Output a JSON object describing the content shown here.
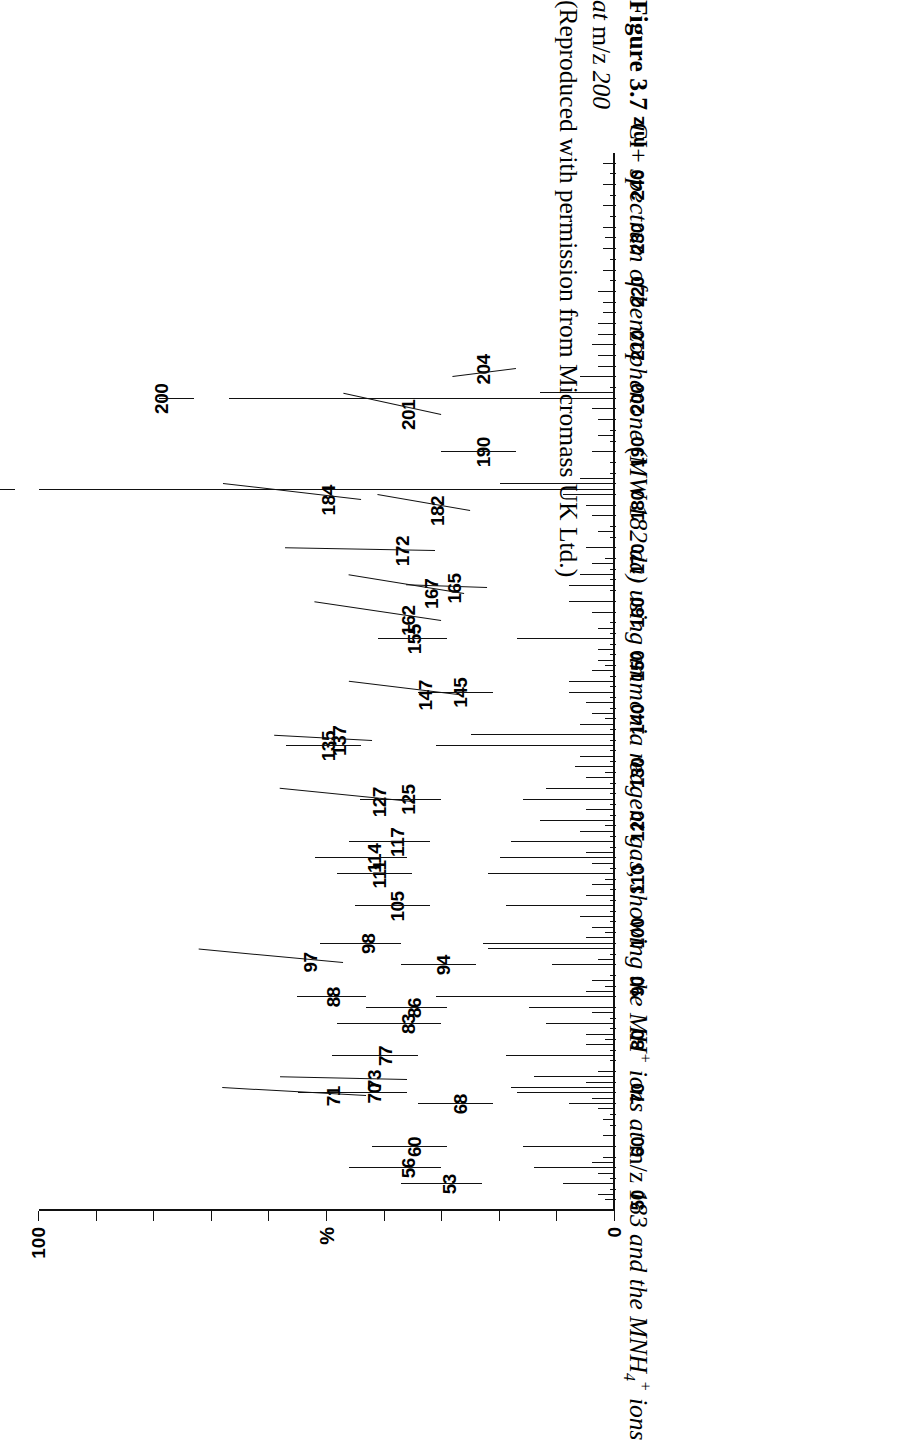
{
  "figure": {
    "label": "Figure 3.7",
    "caption_line1_a": "CI+ ",
    "caption_line1_b": "spectrum of benzophenone (MW 182 da) using ammonia reagent gas, showing the MH",
    "caption_line1_sup": "+",
    "caption_line1_c": " ions at ",
    "caption_line1_d": "m/z",
    "caption_line1_e": " 183 and the MNH",
    "caption_line1_sub": "4",
    "caption_line1_sup2": "+",
    "caption_line1_f": " ions",
    "caption_line2_a": "at ",
    "caption_line2_b": "m/z",
    "caption_line2_c": " 200",
    "caption_line3": "(Reproduced with permission from Micromass UK Ltd.)"
  },
  "axes": {
    "y_top_label": "100",
    "y_mid_label": "%",
    "y_zero_label": "0",
    "x_unit_label": "m/z",
    "x_tick_labels": [
      "50",
      "60",
      "70",
      "80",
      "90",
      "100",
      "110",
      "120",
      "130",
      "140",
      "150",
      "160",
      "170",
      "180",
      "190",
      "200",
      "210",
      "220",
      "230",
      "240"
    ]
  },
  "chart_data": {
    "type": "bar",
    "title": "CI+ spectrum of benzophenone (MW 182 da) using ammonia reagent gas",
    "xlabel": "m/z",
    "ylabel": "%",
    "xlim": [
      48,
      246
    ],
    "ylim": [
      0,
      100
    ],
    "grid": false,
    "legend": "none",
    "x_major_tick_interval": 10,
    "x_minor_tick_interval": 2,
    "base_peak_mz": 183,
    "x": [
      51,
      53,
      55,
      56,
      57,
      58,
      60,
      62,
      65,
      67,
      68,
      69,
      70,
      71,
      72,
      73,
      74,
      77,
      79,
      81,
      83,
      85,
      86,
      88,
      89,
      91,
      94,
      95,
      97,
      98,
      99,
      101,
      103,
      105,
      107,
      109,
      111,
      113,
      114,
      115,
      117,
      119,
      121,
      123,
      125,
      127,
      129,
      131,
      133,
      135,
      137,
      139,
      141,
      143,
      145,
      147,
      149,
      151,
      153,
      155,
      157,
      160,
      162,
      165,
      167,
      169,
      172,
      175,
      178,
      180,
      182,
      183,
      184,
      185,
      190,
      193,
      196,
      198,
      200,
      201,
      204,
      206,
      208,
      210,
      212,
      214,
      216,
      218,
      220,
      224,
      228,
      232,
      236,
      240,
      244
    ],
    "y": [
      3,
      9,
      3,
      14,
      4,
      2,
      16,
      2,
      2,
      3,
      8,
      4,
      17,
      18,
      5,
      14,
      3,
      19,
      5,
      5,
      12,
      4,
      15,
      31,
      5,
      4,
      11,
      3,
      22,
      23,
      5,
      4,
      6,
      19,
      5,
      4,
      22,
      4,
      20,
      5,
      18,
      6,
      13,
      5,
      16,
      12,
      5,
      7,
      6,
      31,
      25,
      6,
      4,
      5,
      8,
      8,
      4,
      3,
      3,
      17,
      3,
      4,
      8,
      8,
      6,
      4,
      5,
      3,
      4,
      5,
      9,
      100,
      20,
      6,
      4,
      3,
      3,
      4,
      67,
      13,
      6,
      3,
      3,
      4,
      3,
      3,
      2,
      2,
      3,
      2,
      2,
      2,
      2,
      2,
      2
    ],
    "annotated_peaks": [
      {
        "mz": 53,
        "label": "53"
      },
      {
        "mz": 56,
        "label": "56"
      },
      {
        "mz": 60,
        "label": "60"
      },
      {
        "mz": 68,
        "label": "68"
      },
      {
        "mz": 70,
        "label": "70"
      },
      {
        "mz": 71,
        "label": "71"
      },
      {
        "mz": 73,
        "label": "73"
      },
      {
        "mz": 77,
        "label": "77"
      },
      {
        "mz": 83,
        "label": "83"
      },
      {
        "mz": 86,
        "label": "86"
      },
      {
        "mz": 88,
        "label": "88"
      },
      {
        "mz": 94,
        "label": "94"
      },
      {
        "mz": 97,
        "label": "97"
      },
      {
        "mz": 98,
        "label": "98"
      },
      {
        "mz": 105,
        "label": "105"
      },
      {
        "mz": 111,
        "label": "111"
      },
      {
        "mz": 114,
        "label": "114"
      },
      {
        "mz": 117,
        "label": "117"
      },
      {
        "mz": 125,
        "label": "125"
      },
      {
        "mz": 127,
        "label": "127"
      },
      {
        "mz": 135,
        "label": "135"
      },
      {
        "mz": 137,
        "label": "137"
      },
      {
        "mz": 145,
        "label": "145"
      },
      {
        "mz": 147,
        "label": "147"
      },
      {
        "mz": 155,
        "label": "155"
      },
      {
        "mz": 162,
        "label": "162"
      },
      {
        "mz": 165,
        "label": "165"
      },
      {
        "mz": 167,
        "label": "167"
      },
      {
        "mz": 172,
        "label": "172"
      },
      {
        "mz": 182,
        "label": "182"
      },
      {
        "mz": 183,
        "label": "183"
      },
      {
        "mz": 184,
        "label": "184"
      },
      {
        "mz": 190,
        "label": "190"
      },
      {
        "mz": 200,
        "label": "200"
      },
      {
        "mz": 201,
        "label": "201"
      },
      {
        "mz": 204,
        "label": "204"
      }
    ]
  }
}
